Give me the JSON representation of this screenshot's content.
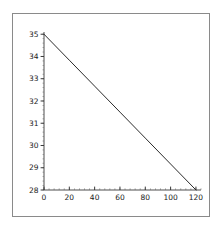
{
  "figure": {
    "background_color": "#ffffff",
    "frame_color": "#8a8a8a",
    "axis_color": "#3a3a3a",
    "line_color": "#2b2b2b",
    "title": "",
    "caption": ""
  },
  "chart_data": {
    "type": "line",
    "title": "",
    "subtitle": "",
    "xlabel": "",
    "ylabel": "",
    "xlim": [
      0,
      124
    ],
    "ylim": [
      28,
      35.1
    ],
    "xticks": [
      0,
      20,
      40,
      60,
      80,
      100,
      120
    ],
    "xtick_labels": [
      "0",
      "20",
      "40",
      "60",
      "80",
      "100",
      "120"
    ],
    "yticks": [
      28,
      29,
      30,
      31,
      32,
      33,
      34,
      35
    ],
    "ytick_labels": [
      "28",
      "29",
      "30",
      "31",
      "32",
      "33",
      "34",
      "35"
    ],
    "x_minor_tick_step": 4,
    "y_minor_tick_step": 0.2,
    "grid": false,
    "legend": null,
    "legend_position": "none",
    "annotations": [],
    "series": [
      {
        "name": "line",
        "color": "#2b2b2b",
        "line_width": 1,
        "x": [
          0,
          120
        ],
        "values": [
          35,
          28
        ],
        "points": [
          {
            "x": 0,
            "y": 35
          },
          {
            "x": 20,
            "y": 33.8333
          },
          {
            "x": 40,
            "y": 32.6667
          },
          {
            "x": 60,
            "y": 31.5
          },
          {
            "x": 80,
            "y": 30.3333
          },
          {
            "x": 100,
            "y": 29.1667
          },
          {
            "x": 120,
            "y": 28
          }
        ],
        "slope": -0.058333,
        "intercept": 35
      }
    ]
  }
}
